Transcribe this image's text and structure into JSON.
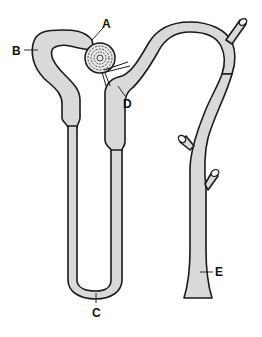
{
  "diagram": {
    "labels": {
      "A": "A",
      "B": "B",
      "C": "C",
      "D": "D",
      "E": "E"
    },
    "colors": {
      "tube_fill": "#d9d9d9",
      "outline": "#1a1a1a",
      "background": "#ffffff"
    }
  }
}
